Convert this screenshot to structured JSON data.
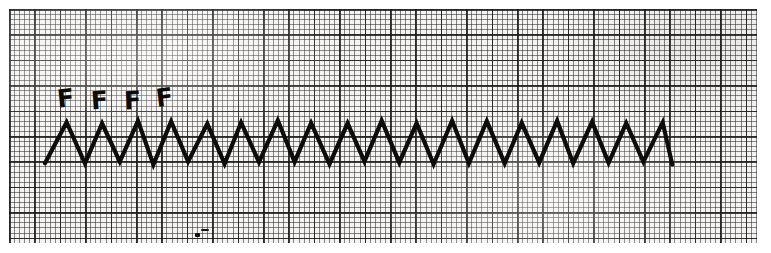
{
  "figure": {
    "kind": "ecg-rhythm-strip",
    "width": 771,
    "height": 253,
    "paper": {
      "background_color": "#f4f3f1",
      "fine_grid_color": "#282624",
      "bold_grid_color": "#191716",
      "fine_grid_spacing_px": 5.08,
      "bold_grid_spacing_px": 25.4,
      "left": 9,
      "top": 9,
      "width": 748,
      "height": 234
    },
    "trace": {
      "color": "#0d0c0b",
      "stroke_width": 4.2,
      "baseline_y": 163,
      "peak_y": 122,
      "start_x": 45,
      "end_x": 672,
      "period_px": 35,
      "cycles": 18,
      "pattern": "sawtooth",
      "description": "continuous sawtooth flutter waves"
    },
    "labels": {
      "flutter_wave_text": "F",
      "markers": [
        {
          "text": "F",
          "x": 57,
          "y": 86,
          "rotate": -6
        },
        {
          "text": "F",
          "x": 91,
          "y": 88,
          "rotate": -4
        },
        {
          "text": "F",
          "x": 124,
          "y": 88,
          "rotate": -3
        },
        {
          "text": "F",
          "x": 156,
          "y": 85,
          "rotate": -7
        }
      ]
    },
    "artifacts": [
      {
        "x": 195,
        "y": 233,
        "w": 5,
        "h": 4
      },
      {
        "x": 201,
        "y": 229,
        "w": 8,
        "h": 2
      }
    ]
  },
  "chart_data": {
    "type": "line",
    "title": "",
    "subtitle": "",
    "xlabel": "",
    "ylabel": "",
    "grid": true,
    "legend_position": "none",
    "annotations": [
      "F",
      "F",
      "F",
      "F"
    ],
    "waveform": {
      "name": "Atrial flutter - sawtooth F waves",
      "units_x": "seconds",
      "units_y": "millivolts",
      "paper_speed_mm_per_s": 25,
      "gain_mm_per_mV": 10,
      "px_per_mm": 5.08,
      "baseline_y_px": 163,
      "peak_y_px": 122,
      "amplitude_px": 41,
      "period_px": 35,
      "cycle_count": 18,
      "peaks_x_px": [
        67,
        102,
        137,
        172,
        207,
        242,
        277,
        312,
        347,
        382,
        417,
        452,
        487,
        522,
        557,
        592,
        627,
        662
      ],
      "troughs_x_px": [
        45,
        84,
        119,
        154,
        189,
        224,
        259,
        294,
        329,
        364,
        399,
        434,
        469,
        504,
        539,
        574,
        609,
        644,
        672
      ]
    }
  }
}
